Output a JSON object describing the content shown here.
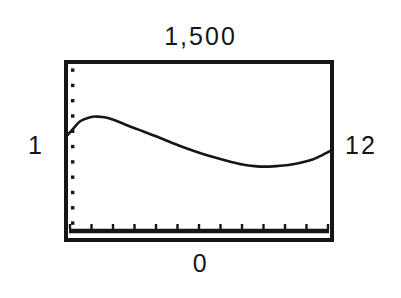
{
  "figure": {
    "background_color": "#ffffff",
    "ink_color": "#161616"
  },
  "labels": {
    "title": "1,500",
    "left": "1",
    "right": "12",
    "bottom": "0"
  },
  "chart_data": {
    "type": "line",
    "title": "1,500",
    "xlabel": "",
    "ylabel": "",
    "grid": false,
    "legend": false,
    "xlim": [
      1,
      12
    ],
    "ylim": [
      0,
      1500
    ],
    "x_tick_labels": [
      "1",
      "12"
    ],
    "y_tick_labels": [
      "0",
      "1,500"
    ],
    "x_major_ticks": 12,
    "y_major_ticks": 11,
    "series": [
      {
        "name": "series-1",
        "x": [
          1.0,
          1.3,
          1.6,
          2.0,
          2.3,
          2.7,
          3.1,
          3.6,
          4.2,
          4.8,
          5.4,
          6.0,
          6.6,
          7.2,
          7.8,
          8.3,
          8.8,
          9.2,
          9.7,
          10.2,
          10.7,
          11.2,
          11.6,
          12.0
        ],
        "values": [
          855,
          930,
          1000,
          1035,
          1040,
          1030,
          1000,
          955,
          905,
          855,
          800,
          750,
          705,
          665,
          630,
          605,
          590,
          585,
          590,
          600,
          620,
          650,
          690,
          735
        ]
      }
    ]
  },
  "geometry": {
    "plot_left": 66,
    "plot_top": 62,
    "plot_right": 332,
    "plot_bottom": 240,
    "baseline_y": 231
  }
}
